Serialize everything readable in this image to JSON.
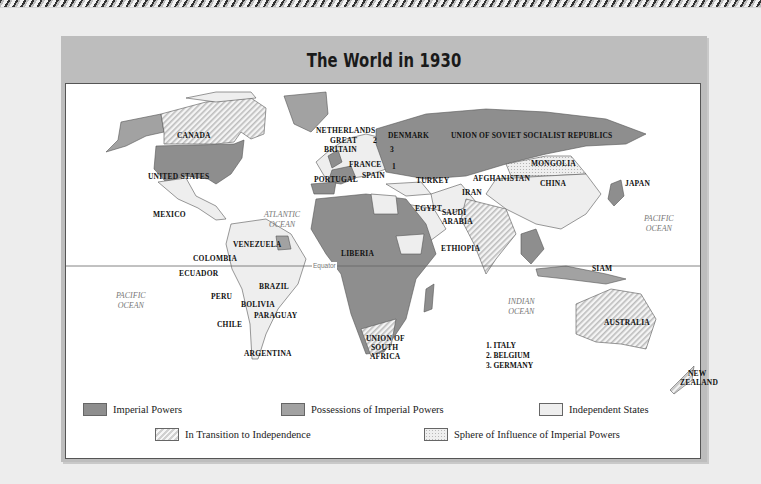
{
  "title": "The World in 1930",
  "colors": {
    "imperial_powers": "#8e8e8e",
    "possessions": "#a2a2a2",
    "independent": "#eeeeee",
    "transition_hatch": "#d0d0d0",
    "sphere_dots": "#b8b8b8",
    "panel": "#bdbdbd",
    "background": "#ededed"
  },
  "labels": {
    "canada": "CANADA",
    "united_states": "UNITED STATES",
    "mexico": "MEXICO",
    "venezuela": "VENEZUELA",
    "colombia": "COLOMBIA",
    "ecuador": "ECUADOR",
    "brazil": "BRAZIL",
    "peru": "PERU",
    "bolivia": "BOLIVIA",
    "paraguay": "PARAGUAY",
    "chile": "CHILE",
    "argentina": "ARGENTINA",
    "netherlands": "NETHERLANDS",
    "great_britain_1": "GREAT",
    "great_britain_2": "BRITAIN",
    "france": "FRANCE",
    "spain": "SPAIN",
    "portugal": "PORTUGAL",
    "denmark": "DENMARK",
    "ussr": "UNION OF SOVIET  SOCIALIST REPUBLICS",
    "turkey": "TURKEY",
    "iran": "IRAN",
    "afghanistan": "AFGHANISTAN",
    "mongolia": "MONGOLIA",
    "china": "CHINA",
    "japan": "JAPAN",
    "egypt": "EGYPT",
    "saudi_1": "SAUDI",
    "saudi_2": "ARABIA",
    "ethiopia": "ETHIOPIA",
    "liberia": "LIBERIA",
    "siam": "SIAM",
    "south_africa_1": "UNION OF",
    "south_africa_2": "SOUTH",
    "south_africa_3": "AFRICA",
    "australia": "AUSTRALIA",
    "nz_1": "NEW",
    "nz_2": "ZEALAND",
    "num_1": "1",
    "num_2": "2",
    "num_3": "3"
  },
  "oceans": {
    "atlantic_1": "ATLANTIC",
    "atlantic_2": "OCEAN",
    "pacific_w_1": "PACIFIC",
    "pacific_w_2": "OCEAN",
    "pacific_e_1": "PACIFIC",
    "pacific_e_2": "OCEAN",
    "indian_1": "INDIAN",
    "indian_2": "OCEAN"
  },
  "equator_label": "Equator",
  "key_list": [
    "1.  ITALY",
    "2.  BELGIUM",
    "3.  GERMANY"
  ],
  "legend": {
    "imperial_powers": "Imperial Powers",
    "possessions": "Possessions of Imperial Powers",
    "independent": "Independent States",
    "transition": "In Transition to Independence",
    "sphere": "Sphere of Influence of Imperial Powers"
  }
}
